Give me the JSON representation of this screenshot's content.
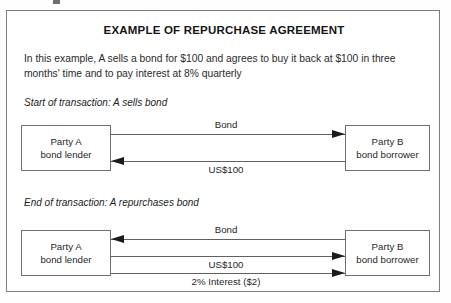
{
  "figure": {
    "title": "EXAMPLE OF REPURCHASE AGREEMENT",
    "intro": "In this example, A sells a bond for $100 and agrees to buy it back at $100 in three months' time and to pay interest at 8% quarterly",
    "frame_color": "#7d7d7d",
    "line_color": "#606060",
    "arrow_color": "#1b1b1b"
  },
  "sections": [
    {
      "caption": "Start of transaction: A sells bond",
      "left_box": {
        "line1": "Party A",
        "line2": "bond lender"
      },
      "right_box": {
        "line1": "Party B",
        "line2": "bond borrower"
      },
      "flows": [
        {
          "label": "Bond",
          "direction": "right"
        },
        {
          "label": "US$100",
          "direction": "left"
        }
      ]
    },
    {
      "caption": "End of transaction: A repurchases bond",
      "left_box": {
        "line1": "Party A",
        "line2": "bond lender"
      },
      "right_box": {
        "line1": "Party B",
        "line2": "bond borrower"
      },
      "flows": [
        {
          "label": "Bond",
          "direction": "left"
        },
        {
          "label": "US$100",
          "direction": "right"
        },
        {
          "label": "2% Interest ($2)",
          "direction": "right"
        }
      ]
    }
  ]
}
